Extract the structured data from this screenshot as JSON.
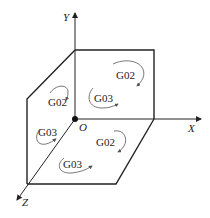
{
  "diagram": {
    "type": "3d-coordinate-planes",
    "axes": {
      "x_label": "X",
      "y_label": "Y",
      "z_label": "Z",
      "origin_label": "O"
    },
    "planes": [
      {
        "name": "XY",
        "labels": [
          {
            "text": "G02",
            "direction": "clockwise"
          },
          {
            "text": "G03",
            "direction": "counterclockwise"
          }
        ]
      },
      {
        "name": "YZ",
        "labels": [
          {
            "text": "G02",
            "direction": "clockwise"
          },
          {
            "text": "G03",
            "direction": "counterclockwise"
          }
        ]
      },
      {
        "name": "XZ",
        "labels": [
          {
            "text": "G02",
            "direction": "clockwise"
          },
          {
            "text": "G03",
            "direction": "counterclockwise"
          }
        ]
      }
    ],
    "colors": {
      "line": "#222222",
      "arc": "#555555",
      "background": "#ffffff"
    }
  }
}
